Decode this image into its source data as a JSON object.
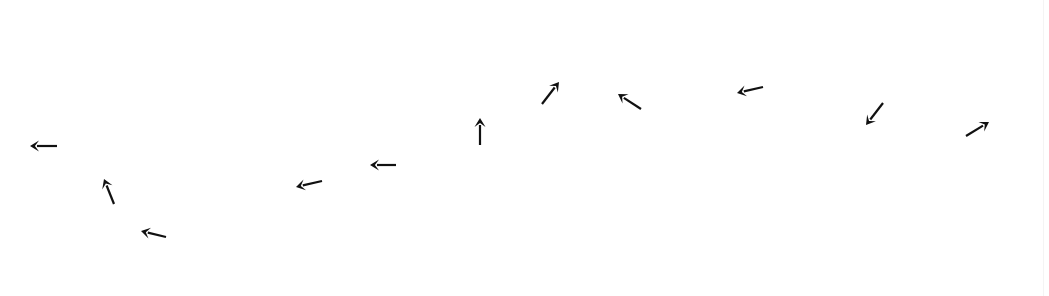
{
  "canvas": {
    "width": 1049,
    "height": 296,
    "background": "#ffffff"
  },
  "style": {
    "arrow_color": "#111111",
    "stroke_width": 2.2,
    "head_length": 9,
    "head_width": 11
  },
  "arrows": [
    {
      "id": 1,
      "direction": "left",
      "tail": [
        57,
        146
      ],
      "tip": [
        30,
        146
      ]
    },
    {
      "id": 2,
      "direction": "up-left",
      "tail": [
        114,
        204
      ],
      "tip": [
        104,
        179
      ]
    },
    {
      "id": 3,
      "direction": "left",
      "tail": [
        166,
        237
      ],
      "tip": [
        141,
        231
      ]
    },
    {
      "id": 4,
      "direction": "left",
      "tail": [
        322,
        181
      ],
      "tip": [
        296,
        187
      ]
    },
    {
      "id": 5,
      "direction": "left",
      "tail": [
        396,
        165
      ],
      "tip": [
        370,
        165
      ]
    },
    {
      "id": 6,
      "direction": "up",
      "tail": [
        480,
        145
      ],
      "tip": [
        480,
        118
      ]
    },
    {
      "id": 7,
      "direction": "up-right",
      "tail": [
        542,
        104
      ],
      "tip": [
        559,
        82
      ]
    },
    {
      "id": 8,
      "direction": "up-left",
      "tail": [
        641,
        109
      ],
      "tip": [
        618,
        94
      ]
    },
    {
      "id": 9,
      "direction": "left",
      "tail": [
        763,
        87
      ],
      "tip": [
        737,
        93
      ]
    },
    {
      "id": 10,
      "direction": "down-left",
      "tail": [
        883,
        103
      ],
      "tip": [
        866,
        125
      ]
    },
    {
      "id": 11,
      "direction": "up-right",
      "tail": [
        966,
        136
      ],
      "tip": [
        989,
        122
      ]
    }
  ]
}
